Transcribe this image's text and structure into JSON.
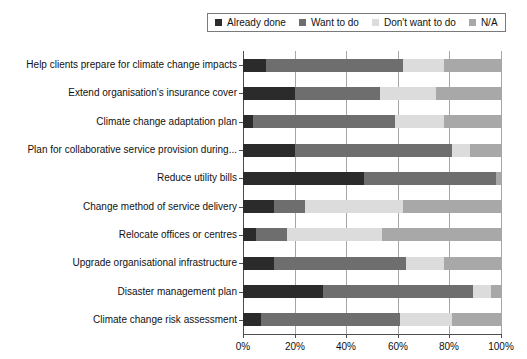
{
  "chart_data": {
    "type": "bar",
    "orientation": "horizontal",
    "stacked": true,
    "normalized": true,
    "title": "",
    "subtitle": "",
    "xlabel": "",
    "ylabel": "",
    "xlim": [
      0,
      100
    ],
    "xticks": [
      0,
      20,
      40,
      60,
      80,
      100
    ],
    "xtick_labels": [
      "0%",
      "20%",
      "40%",
      "60%",
      "80%",
      "100%"
    ],
    "grid": true,
    "grid_axis": "x",
    "legend_position": "top-center",
    "categories": [
      "Help clients prepare for climate change impacts",
      "Extend organisation's insurance cover",
      "Climate change adaptation plan",
      "Plan for collaborative service provision during...",
      "Reduce utility bills",
      "Change method of service delivery",
      "Relocate offices or centres",
      "Upgrade organisational infrastructure",
      "Disaster management plan",
      "Climate change risk assessment"
    ],
    "series": [
      {
        "name": "Already done",
        "color": "#2b2b2b",
        "values": [
          9,
          20,
          4,
          20,
          47,
          12,
          5,
          12,
          31,
          7
        ]
      },
      {
        "name": "Want to do",
        "color": "#6e6e6e",
        "values": [
          53,
          33,
          55,
          61,
          51,
          12,
          12,
          51,
          58,
          54
        ]
      },
      {
        "name": "Don't want to do",
        "color": "#dcdcdc",
        "values": [
          16,
          22,
          19,
          7,
          0,
          38,
          37,
          15,
          7,
          20
        ]
      },
      {
        "name": "N/A",
        "color": "#a8a8a8",
        "values": [
          22,
          25,
          22,
          12,
          2,
          38,
          46,
          22,
          4,
          19
        ]
      }
    ]
  },
  "legend": {
    "items": [
      {
        "label": "Already done",
        "color": "#2b2b2b"
      },
      {
        "label": "Want to do",
        "color": "#6e6e6e"
      },
      {
        "label": "Don't want to do",
        "color": "#dcdcdc"
      },
      {
        "label": "N/A",
        "color": "#a8a8a8"
      }
    ]
  }
}
